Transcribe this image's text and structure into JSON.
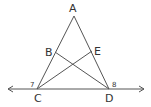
{
  "diagram": {
    "points": {
      "A": {
        "label": "A",
        "x": 74,
        "y": 16
      },
      "B": {
        "label": "B",
        "x": 55,
        "y": 52
      },
      "C": {
        "label": "C",
        "x": 37,
        "y": 89
      },
      "D": {
        "label": "D",
        "x": 109,
        "y": 89
      },
      "E": {
        "label": "E",
        "x": 92,
        "y": 51
      }
    },
    "angles": {
      "at_C": "7",
      "at_D": "8"
    },
    "segments": [
      "AC",
      "AD",
      "BD",
      "CE"
    ],
    "line": {
      "through": [
        "C",
        "D"
      ],
      "arrows": "both"
    }
  }
}
